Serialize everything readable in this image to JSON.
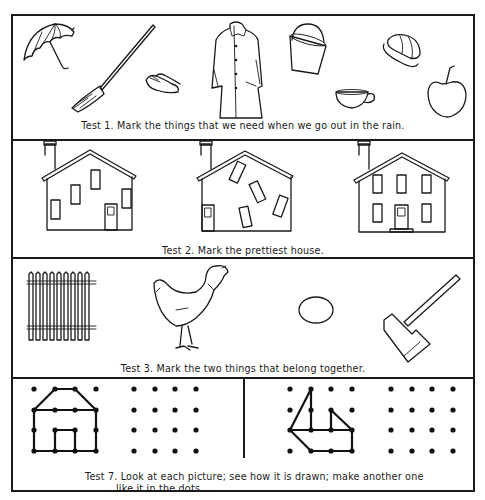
{
  "worksheet": {
    "tests": [
      {
        "id": "test-1",
        "caption": "Test 1.  Mark the things that we need when we go out in the rain.",
        "items": [
          "umbrella",
          "broom",
          "rubbers",
          "raincoat",
          "pail",
          "rain hat",
          "teacup",
          "apple"
        ]
      },
      {
        "id": "test-2",
        "caption": "Test 2.  Mark the prettiest house.",
        "items": [
          "house with scattered windows",
          "house with tilted windows",
          "house with orderly windows"
        ]
      },
      {
        "id": "test-3",
        "caption": "Test 3.  Mark the two things that belong together.",
        "items": [
          "picket fence",
          "hen",
          "egg",
          "hatchet"
        ]
      },
      {
        "id": "test-7",
        "caption_line1": "Test 7.  Look at each picture; see how it is drawn; make another one",
        "caption_line2": "like it in the dots.",
        "items": [
          "house dot drawing",
          "empty 4x4 dot grid",
          "boat dot drawing",
          "empty 4x4 dot grid"
        ]
      }
    ]
  }
}
